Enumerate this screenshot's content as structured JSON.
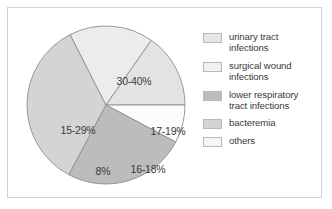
{
  "chart_data": {
    "type": "pie",
    "title": "",
    "subtitle": "",
    "xlabel": "",
    "ylabel": "",
    "legend_position": "right",
    "grid": false,
    "categories": [
      "urinary tract infections",
      "surgical wound infections",
      "lower respiratory tract infections",
      "bacteremia",
      "others"
    ],
    "slice_labels": [
      "30-40%",
      "17-19%",
      "16-18%",
      "8%",
      "15-29%"
    ],
    "values": [
      35,
      18,
      17,
      8,
      22
    ],
    "slices": [
      {
        "label": "30-40%",
        "category": "urinary tract infections",
        "value": 35,
        "color": "#d4d4d4",
        "start_angle": -152,
        "end_angle": -27,
        "label_x": 112,
        "label_y": 60
      },
      {
        "label": "17-19%",
        "category": "surgical wound infections",
        "value": 18,
        "color": "#ececec",
        "start_angle": -27,
        "end_angle": 35,
        "label_x": 146,
        "label_y": 110
      },
      {
        "label": "16-18%",
        "category": "bacteremia",
        "value": 17,
        "color": "#e3e3e3",
        "start_angle": 35,
        "end_angle": 90,
        "label_x": 126,
        "label_y": 148
      },
      {
        "label": "8%",
        "category": "others",
        "value": 8,
        "color": "#fbfbfb",
        "start_angle": 90,
        "end_angle": 118,
        "label_x": 81,
        "label_y": 150
      },
      {
        "label": "15-29%",
        "category": "lower respiratory tract infections",
        "value": 22,
        "color": "#bcbcbc",
        "start_angle": 118,
        "end_angle": 208,
        "label_x": 56,
        "label_y": 109
      }
    ]
  },
  "legend": {
    "items": [
      {
        "label": "urinary tract\ninfections",
        "color": "#e6e6e6"
      },
      {
        "label": "surgical wound\ninfections",
        "color": "#f1f1f1"
      },
      {
        "label": "lower respiratory\ntract infections",
        "color": "#bcbcbc"
      },
      {
        "label": "bacteremia",
        "color": "#d4d4d4"
      },
      {
        "label": "others",
        "color": "#f6f6f6"
      }
    ]
  },
  "style": {
    "frame_color": "#d2d2d2",
    "background": "#ffffff",
    "slice_outline": "#8f8f8f",
    "text_color": "#3a3a3a"
  }
}
